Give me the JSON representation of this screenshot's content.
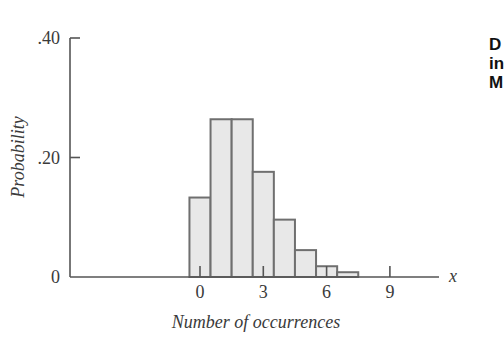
{
  "chart_data": {
    "type": "bar",
    "title": "",
    "xlabel": "Number of occurrences",
    "ylabel": "Probability",
    "x_axis_symbol": "x",
    "categories": [
      0,
      1,
      2,
      3,
      4,
      5,
      6,
      7
    ],
    "values": [
      0.133,
      0.264,
      0.264,
      0.176,
      0.096,
      0.045,
      0.018,
      0.008
    ],
    "x_ticks": [
      0,
      3,
      6,
      9
    ],
    "x_tick_labels": [
      "0",
      "3",
      "6",
      "9"
    ],
    "y_ticks": [
      0,
      0.2,
      0.4
    ],
    "y_tick_labels": [
      "0",
      ".20",
      ".40"
    ],
    "ylim": [
      0,
      0.4
    ],
    "xlim": [
      -6,
      11.3
    ],
    "grid": false,
    "legend": null,
    "bar_fill": "#e8e8e8",
    "bar_edge": "#6f6f6f",
    "axis_color": "#555555"
  },
  "side_text": {
    "lines": [
      "D",
      "in",
      "M"
    ]
  }
}
